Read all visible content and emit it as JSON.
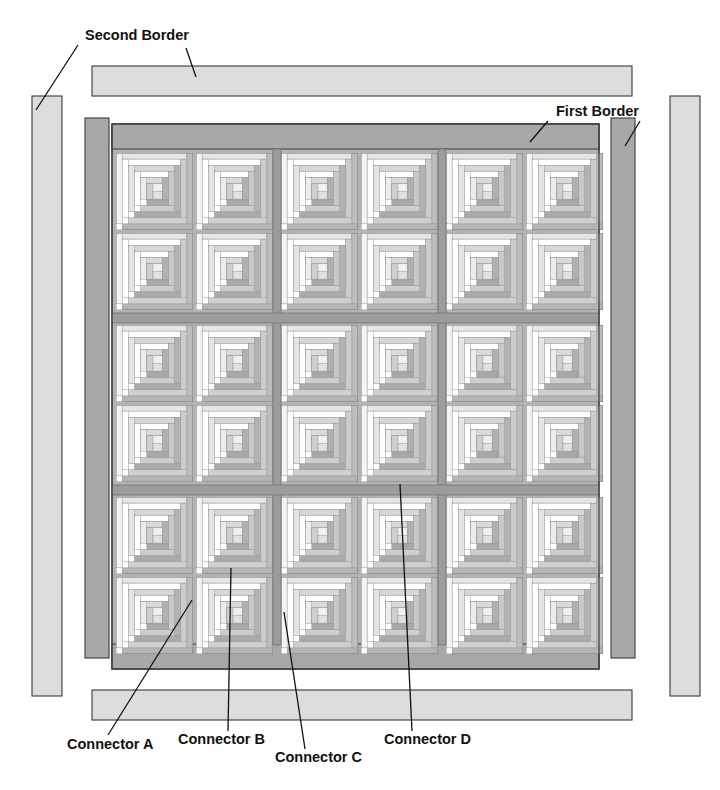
{
  "diagram": {
    "canvas": {
      "width": 720,
      "height": 790
    }
  },
  "labels": [
    {
      "id": "second-border",
      "text": "Second Border",
      "x": 85,
      "y": 40
    },
    {
      "id": "first-border",
      "text": "First Border",
      "x": 556,
      "y": 116
    },
    {
      "id": "connector-a",
      "text": "Connector A",
      "x": 67,
      "y": 749
    },
    {
      "id": "connector-b",
      "text": "Connector B",
      "x": 178,
      "y": 744
    },
    {
      "id": "connector-c",
      "text": "Connector C",
      "x": 275,
      "y": 762
    },
    {
      "id": "connector-d",
      "text": "Connector D",
      "x": 384,
      "y": 744
    }
  ],
  "leader_lines": [
    {
      "id": "leader-second-border-left",
      "points": "78,45 36,110"
    },
    {
      "id": "leader-second-border-strip",
      "points": "186,48 196,75"
    },
    {
      "id": "leader-first-border-top",
      "points": "545,120 533,142"
    },
    {
      "id": "leader-first-border-right",
      "points": "638,120 628,144"
    },
    {
      "id": "leader-connector-a",
      "points": "104,738 192,600"
    },
    {
      "id": "leader-connector-b",
      "points": "228,733 231,568"
    },
    {
      "id": "leader-connector-c",
      "points": "303,751 284,612"
    },
    {
      "id": "leader-connector-d",
      "points": "410,733 400,484"
    }
  ],
  "colors": {
    "background": "#ffffff",
    "outline": "#3a3a3a",
    "second_border_fill": "#dcdcdc",
    "first_border_fill": "#a8a8a8",
    "sashing_fill": "#b3b3b3",
    "block_light": "#ffffff",
    "block_light_2": "#f2f2f2",
    "block_mid": "#d9d9d9",
    "block_dark": "#b5b5b5",
    "block_darker": "#9e9e9e",
    "text": "#111111"
  },
  "quilt": {
    "grid": {
      "rows": 6,
      "cols": 6,
      "block_groups_across": 3,
      "block_groups_down": 3
    },
    "center": {
      "x": 110,
      "y": 124,
      "width": 510,
      "height": 545
    },
    "first_border": {
      "name": "First Border",
      "top": {
        "x": 112,
        "y": 124,
        "width": 508,
        "height": 24
      },
      "bottom": {
        "x": 112,
        "y": 645,
        "width": 508,
        "height": 24
      },
      "left": {
        "x": 84,
        "y": 118,
        "width": 24,
        "height": 540
      },
      "right": {
        "x": 602,
        "y": 118,
        "width": 24,
        "height": 540
      }
    },
    "second_border": {
      "name": "Second Border",
      "top": {
        "x": 92,
        "y": 66,
        "width": 540,
        "height": 30
      },
      "bottom": {
        "x": 92,
        "y": 690,
        "width": 540,
        "height": 30
      },
      "left": {
        "x": 30,
        "y": 96,
        "width": 30,
        "height": 600
      },
      "right": {
        "x": 672,
        "y": 96,
        "width": 30,
        "height": 600
      }
    },
    "block": {
      "name": "Log Cabin Block",
      "rings": 5,
      "light_side": "top-left",
      "dark_side": "bottom-right"
    }
  }
}
